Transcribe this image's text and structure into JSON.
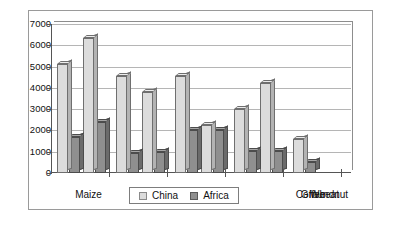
{
  "chart_data": {
    "type": "bar",
    "title": "",
    "xlabel": "",
    "ylabel": "",
    "categories": [
      "Maize",
      "Sorghum",
      "Wheat",
      "Groundnut",
      "Coffee"
    ],
    "series": [
      {
        "name": "China",
        "color": "#dcdcdc",
        "values": [
          5100,
          6350,
          3800,
          2250,
          1600
        ]
      },
      {
        "name": "Africa",
        "color": "#8f8f8f",
        "values": [
          1700,
          2400,
          1000,
          2000,
          500
        ]
      }
    ],
    "extra_bars": {
      "note_visible_pairs": [
        {
          "category": "Maize",
          "china": 5100,
          "africa": 1700
        },
        {
          "category": "Maize2",
          "china": 6350,
          "africa": 2400
        },
        {
          "category": "Sorghum",
          "china": 4550,
          "africa": 950
        },
        {
          "category": "Sorghum2",
          "china": 3800,
          "africa": 1000
        },
        {
          "category": "Wheat",
          "china": 4550,
          "africa": 2000
        },
        {
          "category": "Wheat2",
          "china": 2250,
          "africa": 2000
        },
        {
          "category": "Groundnut",
          "china": 3000,
          "africa": 1050
        },
        {
          "category": "Groundnut2",
          "china": 4250,
          "africa": 1050
        },
        {
          "category": "Coffee",
          "china": 1600,
          "africa": 500
        }
      ]
    },
    "ylim": [
      0,
      7000
    ],
    "ytick_step": 1000,
    "yticks": [
      "0",
      "1000",
      "2000",
      "3000",
      "4000",
      "5000",
      "6000",
      "7000"
    ],
    "grid": true,
    "legend_position": "bottom-center",
    "legend": [
      "China",
      "Africa"
    ]
  },
  "legend": {
    "china_label": "China",
    "africa_label": "Africa"
  }
}
